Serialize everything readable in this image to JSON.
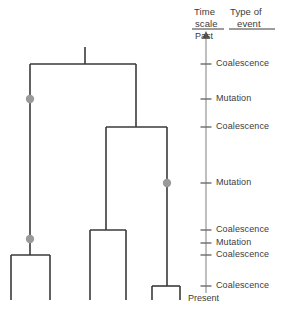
{
  "figure": {
    "headers": {
      "time_scale_line1": "Time",
      "time_scale_line2": "scale",
      "type_of_event_line1": "Type of",
      "type_of_event_line2": "event"
    },
    "axis": {
      "top_label": "Past",
      "bottom_label": "Present",
      "arrow": "up-arrow",
      "x": 206,
      "y_top": 36,
      "y_bottom": 293
    },
    "events": [
      {
        "label": "Coalescence",
        "y": 64
      },
      {
        "label": "Mutation",
        "y": 99
      },
      {
        "label": "Coalescence",
        "y": 127
      },
      {
        "label": "Mutation",
        "y": 183
      },
      {
        "label": "Coalescence",
        "y": 230
      },
      {
        "label": "Mutation",
        "y": 239
      },
      {
        "label": "Coalescence",
        "y": 255
      },
      {
        "label": "Coalescence",
        "y": 286
      }
    ],
    "tree": {
      "stroke": "#3a3a3a",
      "stroke_width": 1.6,
      "mutation_dot_color": "#9a9a9a",
      "mutation_dot_radius": 4.2,
      "root_stub": {
        "x": 85,
        "y_top": 47,
        "y_bottom": 64
      },
      "coalescences": [
        {
          "name": "root-coalescence",
          "y": 64,
          "x_left": 30,
          "x_right": 136
        },
        {
          "name": "right-clade-coalescence",
          "y": 127,
          "x_left": 106,
          "x_right": 167
        },
        {
          "name": "middle-pair-coalescence",
          "y": 230,
          "x_left": 90,
          "x_right": 126
        },
        {
          "name": "left-pair-coalescence",
          "y": 255,
          "x_left": 11,
          "x_right": 50
        },
        {
          "name": "right-pair-coalescence",
          "y": 286,
          "x_left": 152,
          "x_right": 180
        }
      ],
      "verticals": [
        {
          "name": "left-lineage",
          "x": 30,
          "y_top": 64,
          "y_bottom": 255
        },
        {
          "name": "right-clade-lineage",
          "x": 136,
          "y_top": 64,
          "y_bottom": 127
        },
        {
          "name": "middle-lineage",
          "x": 106,
          "y_top": 127,
          "y_bottom": 230
        },
        {
          "name": "right-lineage",
          "x": 167,
          "y_top": 127,
          "y_bottom": 286
        },
        {
          "name": "tip-1",
          "x": 11,
          "y_top": 255,
          "y_bottom": 300
        },
        {
          "name": "tip-2",
          "x": 50,
          "y_top": 255,
          "y_bottom": 300
        },
        {
          "name": "tip-3",
          "x": 90,
          "y_top": 230,
          "y_bottom": 300
        },
        {
          "name": "tip-4",
          "x": 126,
          "y_top": 230,
          "y_bottom": 300
        },
        {
          "name": "tip-5",
          "x": 152,
          "y_top": 286,
          "y_bottom": 300
        },
        {
          "name": "tip-6",
          "x": 180,
          "y_top": 286,
          "y_bottom": 300
        }
      ],
      "mutations": [
        {
          "name": "mutation-left-upper",
          "x": 30,
          "y": 99
        },
        {
          "name": "mutation-right-lineage",
          "x": 167,
          "y": 183
        },
        {
          "name": "mutation-left-lower",
          "x": 30,
          "y": 239
        }
      ]
    }
  }
}
